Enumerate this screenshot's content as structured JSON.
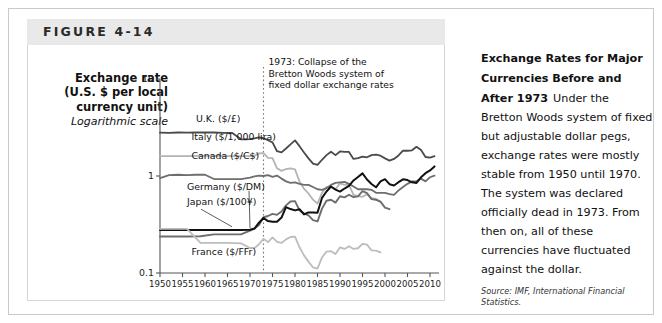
{
  "figure": {
    "banner_label": "FIGURE 4-14"
  },
  "axis_title": {
    "line1": "Exchange rate",
    "line2": "(U.S. $ per local",
    "line3": "currency unit)",
    "scale_note": "Logarithmic scale"
  },
  "annotation": {
    "line1": "1973: Collapse of the",
    "line2": "Bretton Woods system of",
    "line3": "fixed dollar exchange rates",
    "year": 1973
  },
  "side_panel": {
    "heading": "Exchange Rates for Major Currencies Before and After 1973",
    "body": "Under the Bretton Woods system of fixed but adjustable dollar pegs, exchange rates were mostly stable from 1950 until 1970. The system was declared officially dead in 1973. From then on, all of these currencies have fluctuated against the dollar.",
    "source": "Source: IMF, International Financial Statistics."
  },
  "chart_data": {
    "type": "line",
    "title": "Exchange Rates for Major Currencies Before and After 1973",
    "xlabel": "",
    "ylabel": "Exchange rate (U.S. $ per local currency unit)",
    "yscale": "log",
    "ylim": [
      0.1,
      10
    ],
    "ytick_labels": [
      "10",
      "1",
      "0.1"
    ],
    "ytick_values": [
      10,
      1,
      0.1
    ],
    "xlim": [
      1950,
      2012
    ],
    "xtick_labels": [
      "1950",
      "1955",
      "1960",
      "1965",
      "1970",
      "1975",
      "1980",
      "1985",
      "1990",
      "1995",
      "2000",
      "2005",
      "2010"
    ],
    "xtick_values": [
      1950,
      1955,
      1960,
      1965,
      1970,
      1975,
      1980,
      1985,
      1990,
      1995,
      2000,
      2005,
      2010
    ],
    "grid": false,
    "legend": "inline-labels",
    "annotations": [
      {
        "x": 1973,
        "text": "1973: Collapse of the Bretton Woods system of fixed dollar exchange rates",
        "style": "dotted-vertical-line"
      }
    ],
    "series": [
      {
        "name": "U.K. ($/£)",
        "color": "#4a4a4a",
        "width": 1.8,
        "label_x": 1958,
        "label_y": 3.6,
        "x": [
          1950,
          1952,
          1954,
          1956,
          1958,
          1960,
          1962,
          1964,
          1966,
          1968,
          1969,
          1970,
          1971,
          1972,
          1973,
          1974,
          1975,
          1976,
          1977,
          1978,
          1979,
          1980,
          1981,
          1982,
          1983,
          1984,
          1985,
          1986,
          1987,
          1988,
          1989,
          1990,
          1991,
          1992,
          1993,
          1994,
          1995,
          1996,
          1997,
          1998,
          1999,
          2000,
          2001,
          2002,
          2003,
          2004,
          2005,
          2006,
          2007,
          2008,
          2009,
          2010,
          2011
        ],
        "y": [
          2.8,
          2.79,
          2.81,
          2.8,
          2.81,
          2.81,
          2.81,
          2.79,
          2.79,
          2.39,
          2.39,
          2.4,
          2.44,
          2.5,
          2.45,
          2.34,
          2.22,
          1.8,
          1.75,
          1.92,
          2.12,
          2.33,
          2.03,
          1.75,
          1.52,
          1.34,
          1.3,
          1.47,
          1.64,
          1.78,
          1.64,
          1.79,
          1.77,
          1.77,
          1.5,
          1.53,
          1.58,
          1.56,
          1.64,
          1.66,
          1.62,
          1.52,
          1.44,
          1.5,
          1.63,
          1.83,
          1.82,
          1.84,
          2.0,
          1.85,
          1.57,
          1.55,
          1.6
        ]
      },
      {
        "name": "Italy ($/1,000 lira)",
        "color": "#b4b4b4",
        "width": 1.8,
        "label_x": 1957,
        "label_y": 2.35,
        "x": [
          1950,
          1953,
          1956,
          1959,
          1962,
          1965,
          1968,
          1970,
          1971,
          1972,
          1973,
          1974,
          1975,
          1976,
          1977,
          1978,
          1979,
          1980,
          1981,
          1982,
          1983,
          1984,
          1985,
          1986,
          1987,
          1988,
          1989,
          1990,
          1991,
          1992,
          1993,
          1994,
          1995,
          1996,
          1997,
          1998,
          1999
        ],
        "y": [
          1.6,
          1.6,
          1.6,
          1.61,
          1.61,
          1.6,
          1.6,
          1.6,
          1.62,
          1.71,
          1.72,
          1.54,
          1.53,
          1.2,
          1.13,
          1.18,
          1.2,
          1.17,
          0.88,
          0.74,
          0.66,
          0.57,
          0.52,
          0.67,
          0.77,
          0.77,
          0.73,
          0.84,
          0.81,
          0.81,
          0.64,
          0.62,
          0.61,
          0.65,
          0.59,
          0.58,
          0.54
        ]
      },
      {
        "name": "Canada ($/C$)",
        "color": "#6e6e6e",
        "width": 1.8,
        "label_x": 1957,
        "label_y": 1.48,
        "x": [
          1950,
          1952,
          1954,
          1956,
          1958,
          1960,
          1962,
          1964,
          1966,
          1968,
          1970,
          1971,
          1972,
          1973,
          1974,
          1975,
          1976,
          1977,
          1978,
          1979,
          1980,
          1981,
          1982,
          1983,
          1984,
          1985,
          1986,
          1987,
          1988,
          1989,
          1990,
          1991,
          1992,
          1993,
          1994,
          1995,
          1996,
          1997,
          1998,
          1999,
          2000,
          2001,
          2002,
          2003,
          2004,
          2005,
          2006,
          2007,
          2008,
          2009,
          2010,
          2011
        ],
        "y": [
          0.95,
          1.02,
          1.03,
          1.02,
          1.03,
          1.03,
          0.93,
          0.93,
          0.93,
          0.93,
          0.96,
          0.99,
          1.01,
          1.0,
          1.02,
          0.98,
          1.01,
          0.94,
          0.88,
          0.85,
          0.86,
          0.83,
          0.81,
          0.81,
          0.77,
          0.73,
          0.72,
          0.75,
          0.81,
          0.85,
          0.86,
          0.87,
          0.83,
          0.78,
          0.73,
          0.73,
          0.73,
          0.72,
          0.67,
          0.67,
          0.67,
          0.65,
          0.64,
          0.71,
          0.77,
          0.83,
          0.88,
          0.88,
          0.94,
          0.88,
          0.97,
          1.01
        ]
      },
      {
        "name": "Germany ($/DM)",
        "color": "#6e6e6e",
        "width": 1.9,
        "label_x": 1956,
        "label_y": 0.72,
        "leader_to_x": 1970,
        "leader_to_y": 0.29,
        "x": [
          1950,
          1953,
          1956,
          1959,
          1962,
          1965,
          1968,
          1970,
          1971,
          1972,
          1973,
          1974,
          1975,
          1976,
          1977,
          1978,
          1979,
          1980,
          1981,
          1982,
          1983,
          1984,
          1985,
          1986,
          1987,
          1988,
          1989,
          1990,
          1991,
          1992,
          1993,
          1994,
          1995,
          1996,
          1997,
          1998,
          1999,
          2000,
          2001
        ],
        "y": [
          0.238,
          0.238,
          0.238,
          0.239,
          0.25,
          0.25,
          0.25,
          0.273,
          0.287,
          0.313,
          0.376,
          0.387,
          0.407,
          0.398,
          0.431,
          0.498,
          0.546,
          0.551,
          0.443,
          0.412,
          0.392,
          0.351,
          0.34,
          0.461,
          0.556,
          0.569,
          0.532,
          0.619,
          0.602,
          0.641,
          0.605,
          0.617,
          0.698,
          0.665,
          0.577,
          0.569,
          0.545,
          0.472,
          0.455
        ]
      },
      {
        "name": "Japan ($/100¥)",
        "color": "#111111",
        "width": 2.0,
        "label_x": 1956,
        "label_y": 0.5,
        "leader_to_x": 1966,
        "leader_to_y": 0.3,
        "x": [
          1950,
          1953,
          1956,
          1959,
          1962,
          1965,
          1968,
          1970,
          1971,
          1972,
          1973,
          1974,
          1975,
          1976,
          1977,
          1978,
          1979,
          1980,
          1981,
          1982,
          1983,
          1984,
          1985,
          1986,
          1987,
          1988,
          1989,
          1990,
          1991,
          1992,
          1993,
          1994,
          1995,
          1996,
          1997,
          1998,
          1999,
          2000,
          2001,
          2002,
          2003,
          2004,
          2005,
          2006,
          2007,
          2008,
          2009,
          2010,
          2011
        ],
        "y": [
          0.278,
          0.278,
          0.278,
          0.278,
          0.278,
          0.278,
          0.278,
          0.279,
          0.287,
          0.33,
          0.369,
          0.343,
          0.337,
          0.337,
          0.373,
          0.477,
          0.456,
          0.442,
          0.454,
          0.402,
          0.421,
          0.421,
          0.419,
          0.594,
          0.692,
          0.78,
          0.725,
          0.691,
          0.743,
          0.79,
          0.9,
          0.978,
          1.064,
          0.92,
          0.827,
          0.765,
          0.878,
          0.928,
          0.823,
          0.799,
          0.863,
          0.924,
          0.908,
          0.86,
          0.849,
          0.97,
          1.069,
          1.14,
          1.255
        ]
      },
      {
        "name": "France ($/FFr)",
        "color": "#bdbdbd",
        "width": 1.8,
        "label_x": 1957,
        "label_y": 0.155,
        "x": [
          1950,
          1953,
          1956,
          1959,
          1960,
          1962,
          1965,
          1968,
          1970,
          1971,
          1972,
          1973,
          1974,
          1975,
          1976,
          1977,
          1978,
          1979,
          1980,
          1981,
          1982,
          1983,
          1984,
          1985,
          1986,
          1987,
          1988,
          1989,
          1990,
          1991,
          1992,
          1993,
          1994,
          1995,
          1996,
          1997,
          1998,
          1999
        ],
        "y": [
          0.285,
          0.285,
          0.285,
          0.204,
          0.204,
          0.204,
          0.204,
          0.202,
          0.181,
          0.181,
          0.198,
          0.225,
          0.208,
          0.233,
          0.209,
          0.204,
          0.222,
          0.235,
          0.237,
          0.184,
          0.152,
          0.131,
          0.114,
          0.111,
          0.145,
          0.166,
          0.168,
          0.157,
          0.184,
          0.177,
          0.189,
          0.177,
          0.18,
          0.2,
          0.196,
          0.171,
          0.17,
          0.163
        ]
      }
    ]
  }
}
